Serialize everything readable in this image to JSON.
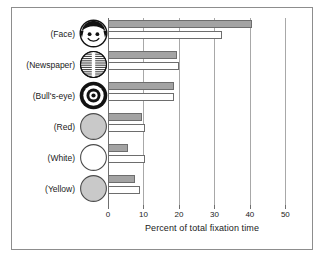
{
  "chart_data": {
    "type": "bar",
    "orientation": "horizontal",
    "title": "",
    "xlabel": "Percent of total fixation time",
    "ylabel": "",
    "xlim": [
      0,
      53
    ],
    "xticks": [
      0,
      10,
      20,
      30,
      40,
      50
    ],
    "xtick_labels": [
      "0",
      "10",
      "20",
      "30",
      "40",
      "50"
    ],
    "grid": true,
    "legend": "none",
    "categories": [
      "(Face)",
      "(Newspaper)",
      "(Bull's-eye)",
      "(Red)",
      "(White)",
      "(Yellow)"
    ],
    "category_icons": [
      "face-icon",
      "newspaper-icon",
      "bullseye-icon",
      "red-disc-icon",
      "white-disc-icon",
      "yellow-disc-icon"
    ],
    "series": [
      {
        "name": "gray",
        "values": [
          40.5,
          19.5,
          18.5,
          9.5,
          5.5,
          7.5
        ]
      },
      {
        "name": "white",
        "values": [
          32.0,
          20.0,
          18.5,
          10.5,
          10.5,
          9.0
        ]
      }
    ],
    "colors": {
      "bar_gray_fill": "#a3a3a3",
      "bar_white_fill": "#ffffff",
      "bar_stroke": "#6d6d6d",
      "gridline": "#a8a8a8",
      "axis": "#6f6f6f",
      "frame": "#8d8d8d",
      "text": "#1a1a1a",
      "disc_gray": "#c9c9c9"
    }
  }
}
